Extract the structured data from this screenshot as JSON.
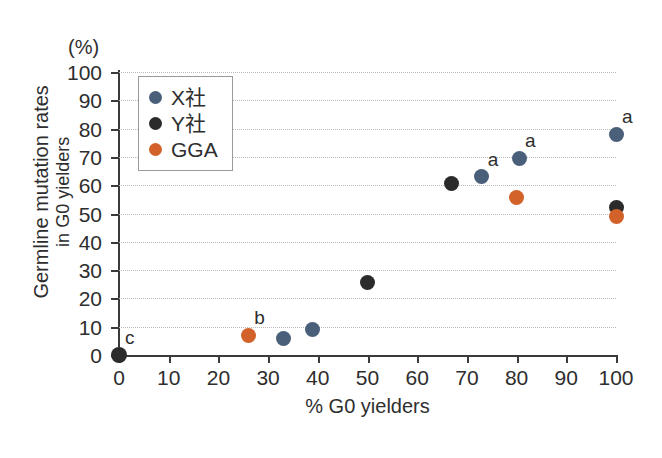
{
  "chart_data": {
    "type": "scatter",
    "title": "",
    "xlabel": "% G0 yielders",
    "ylabel_line1": "Germline mutation rates",
    "ylabel_line2": "in G0 yielders",
    "yunit": "(%)",
    "xlim": [
      0,
      100
    ],
    "ylim": [
      0,
      100
    ],
    "xticks": [
      0,
      10,
      20,
      30,
      40,
      50,
      60,
      70,
      80,
      90,
      100
    ],
    "yticks": [
      0,
      10,
      20,
      30,
      40,
      50,
      60,
      70,
      80,
      90,
      100
    ],
    "grid": "horizontal-dotted",
    "legend_position": "top-left-inside",
    "series": [
      {
        "name": "X社",
        "color": "#4a5f7a",
        "points": [
          {
            "x": 33,
            "y": 6,
            "label": ""
          },
          {
            "x": 39,
            "y": 9,
            "label": ""
          },
          {
            "x": 73,
            "y": 63,
            "label": "a"
          },
          {
            "x": 80.5,
            "y": 69.5,
            "label": "a"
          },
          {
            "x": 100,
            "y": 78,
            "label": "a"
          }
        ]
      },
      {
        "name": "Y社",
        "color": "#2b2b2b",
        "points": [
          {
            "x": 0,
            "y": 0,
            "label": "c"
          },
          {
            "x": 50,
            "y": 25.5,
            "label": ""
          },
          {
            "x": 67,
            "y": 60.5,
            "label": ""
          },
          {
            "x": 100,
            "y": 52,
            "label": ""
          }
        ]
      },
      {
        "name": "GGA",
        "color": "#d2622a",
        "points": [
          {
            "x": 26,
            "y": 7,
            "label": "b"
          },
          {
            "x": 80,
            "y": 55.5,
            "label": ""
          },
          {
            "x": 100,
            "y": 49,
            "label": ""
          }
        ]
      }
    ]
  },
  "legend": {
    "items": [
      {
        "label": "X社",
        "color": "#4a5f7a"
      },
      {
        "label": "Y社",
        "color": "#2b2b2b"
      },
      {
        "label": "GGA",
        "color": "#d2622a"
      }
    ]
  }
}
